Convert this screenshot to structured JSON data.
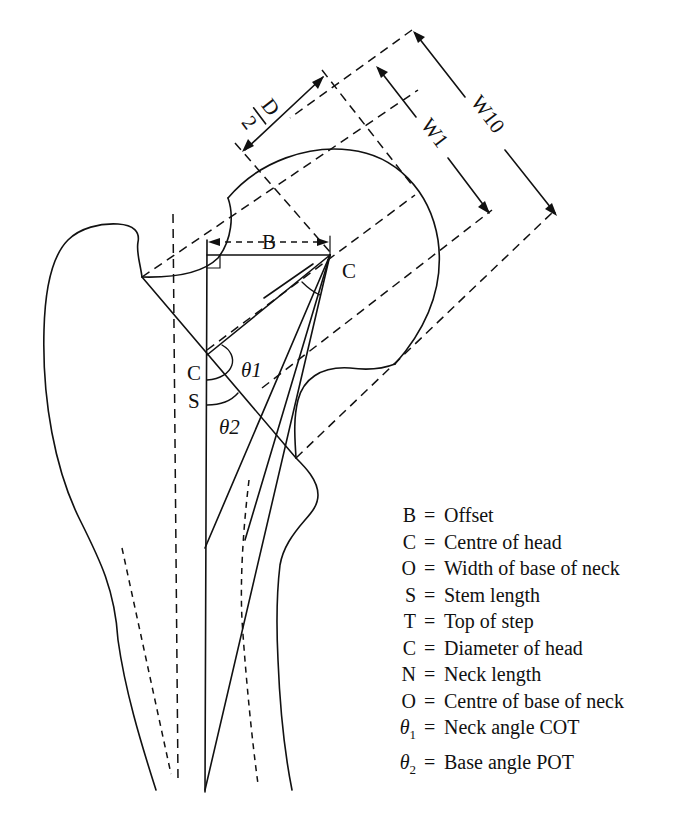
{
  "diagram": {
    "labels": {
      "offset": "B",
      "centre_head": "C",
      "centre_neck": "C",
      "stem": "S",
      "theta1": "θ1",
      "theta2": "θ2",
      "d": "D",
      "d_denominator": "2",
      "w1": "W1",
      "w10": "W10"
    }
  },
  "legend": {
    "items": [
      {
        "key": "B",
        "sub": "",
        "value": "Offset"
      },
      {
        "key": "C",
        "sub": "",
        "value": "Centre of head"
      },
      {
        "key": "O",
        "sub": "",
        "value": "Width of base of neck"
      },
      {
        "key": "S",
        "sub": "",
        "value": "Stem length"
      },
      {
        "key": "T",
        "sub": "",
        "value": "Top of step"
      },
      {
        "key": "C",
        "sub": "",
        "value": "Diameter of head"
      },
      {
        "key": "N",
        "sub": "",
        "value": "Neck length"
      },
      {
        "key": "O",
        "sub": "",
        "value": "Centre of base of neck"
      },
      {
        "key": "θ",
        "sub": "1",
        "value": "Neck angle COT"
      },
      {
        "key": "θ",
        "sub": "2",
        "value": "Base angle POT"
      }
    ],
    "equals": "="
  }
}
